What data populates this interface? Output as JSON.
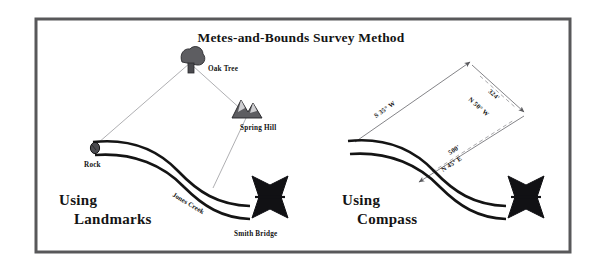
{
  "figure": {
    "title": "Metes-and-Bounds Survey Method",
    "frame": {
      "border_color": "#58585a",
      "background": "#ffffff"
    },
    "ink_color": "#141414",
    "survey_line_color": "#8f8f93"
  },
  "left_panel": {
    "caption_line1": "Using",
    "caption_line2": "Landmarks",
    "landmarks": [
      {
        "id": "oak-tree",
        "label": "Oak Tree",
        "icon": "tree-icon"
      },
      {
        "id": "spring-hill",
        "label": "Spring Hill",
        "icon": "mountain-icon"
      },
      {
        "id": "rock",
        "label": "Rock",
        "icon": "rock-icon"
      },
      {
        "id": "smith-bridge",
        "label": "Smith Bridge",
        "icon": "bridge-icon"
      }
    ],
    "creek_label": "Jones Creek"
  },
  "right_panel": {
    "caption_line1": "Using",
    "caption_line2": "Compass",
    "courses": [
      {
        "id": "course-sw",
        "bearing": "S 35° W",
        "distance": ""
      },
      {
        "id": "course-nw",
        "bearing": "N 50° W",
        "distance": "324'"
      },
      {
        "id": "course-ne",
        "bearing": "N 45° E",
        "distance": "500'"
      }
    ],
    "bridge_label": ""
  }
}
